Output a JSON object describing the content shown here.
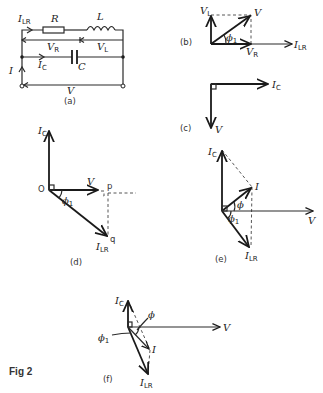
{
  "figure": {
    "caption": "Fig 2",
    "panels": {
      "a": {
        "label": "(a)",
        "components": {
          "resistor": "R",
          "inductor": "L",
          "capacitor": "C"
        },
        "currents": {
          "i_lr": "I",
          "i_lr_sub": "LR",
          "i_c": "I",
          "i_c_sub": "C",
          "i": "I"
        },
        "voltages": {
          "v_r": "V",
          "v_r_sub": "R",
          "v_l": "V",
          "v_l_sub": "L",
          "v": "V"
        }
      },
      "b": {
        "label": "(b)",
        "v_l": "V",
        "v_l_sub": "L",
        "v": "V",
        "phi1": "ϕ",
        "phi1_sub": "1",
        "v_r": "V",
        "v_r_sub": "R",
        "i_lr": "I",
        "i_lr_sub": "LR"
      },
      "c": {
        "label": "(c)",
        "i_c": "I",
        "i_c_sub": "C",
        "v": "V"
      },
      "d": {
        "label": "(d)",
        "i_c": "I",
        "i_c_sub": "C",
        "origin": "O",
        "v": "V",
        "p": "p",
        "q": "q",
        "phi1": "ϕ",
        "phi1_sub": "1",
        "i_lr": "I",
        "i_lr_sub": "LR"
      },
      "e": {
        "label": "(e)",
        "i_c": "I",
        "i_c_sub": "C",
        "i": "I",
        "phi": "ϕ",
        "phi1": "ϕ",
        "phi1_sub": "1",
        "v": "V",
        "i_lr": "I",
        "i_lr_sub": "LR"
      },
      "f": {
        "label": "(f)",
        "i_c": "I",
        "i_c_sub": "C",
        "phi": "ϕ",
        "phi1": "ϕ",
        "phi1_sub": "1",
        "v": "V",
        "i": "I",
        "i_lr": "I",
        "i_lr_sub": "LR"
      }
    }
  }
}
